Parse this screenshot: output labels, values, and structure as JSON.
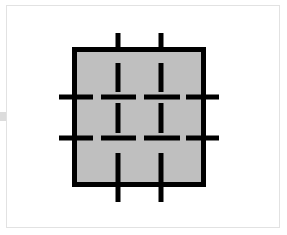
{
  "page": {
    "background_color": "#ffffff",
    "width": 287,
    "height": 235
  },
  "frame": {
    "name": "image-frame",
    "x": 6,
    "y": 5,
    "width": 274,
    "height": 223,
    "border_color": "#e2e2e2",
    "border_width": 1,
    "fill_color": "#ffffff"
  },
  "edge_tick": {
    "name": "left-edge-tick",
    "x": 0,
    "y": 112,
    "width": 6,
    "height": 9,
    "color": "#dcdcdc"
  },
  "chart_data": {
    "type": "diagram",
    "xlabel": "",
    "ylabel": "",
    "grid": true,
    "legend": null,
    "square": {
      "name": "filled-square",
      "x": 72,
      "y": 47,
      "width": 134,
      "height": 140,
      "fill_color": "#bfbfbf",
      "stroke_color": "#000000",
      "stroke_width": 5
    },
    "grid_lines": {
      "stroke_color": "#000000",
      "stroke_width": 5,
      "vertical": [
        {
          "name": "vertical-grid-line-1",
          "x": 118
        },
        {
          "name": "vertical-grid-line-2",
          "x": 161
        }
      ],
      "horizontal": [
        {
          "name": "horizontal-grid-line-1",
          "y": 97
        },
        {
          "name": "horizontal-grid-line-2",
          "y": 138
        }
      ],
      "extent": {
        "vertical_top": 33,
        "vertical_bottom": 202,
        "horizontal_left": 59,
        "horizontal_right": 219
      }
    },
    "vertical_segments": [
      {
        "name": "v1-stub-top",
        "x": 118,
        "y1": 33,
        "y2": 49
      },
      {
        "name": "v1-seg-upper",
        "x": 118,
        "y1": 63,
        "y2": 92
      },
      {
        "name": "v1-seg-middle",
        "x": 118,
        "y1": 103,
        "y2": 133
      },
      {
        "name": "v1-seg-lower",
        "x": 118,
        "y1": 153,
        "y2": 182
      },
      {
        "name": "v1-stub-bottom",
        "x": 118,
        "y1": 186,
        "y2": 202
      },
      {
        "name": "v2-stub-top",
        "x": 161,
        "y1": 33,
        "y2": 49
      },
      {
        "name": "v2-seg-upper",
        "x": 161,
        "y1": 63,
        "y2": 92
      },
      {
        "name": "v2-seg-middle",
        "x": 161,
        "y1": 103,
        "y2": 133
      },
      {
        "name": "v2-seg-lower",
        "x": 161,
        "y1": 153,
        "y2": 182
      },
      {
        "name": "v2-stub-bottom",
        "x": 161,
        "y1": 186,
        "y2": 202
      }
    ],
    "horizontal_segments": [
      {
        "name": "h1-stub-left",
        "y": 97,
        "x1": 59,
        "x2": 93
      },
      {
        "name": "h1-seg-center-a",
        "y": 97,
        "x1": 101,
        "x2": 136
      },
      {
        "name": "h1-seg-center-b",
        "y": 97,
        "x1": 144,
        "x2": 180
      },
      {
        "name": "h1-stub-right",
        "y": 97,
        "x1": 186,
        "x2": 219
      },
      {
        "name": "h2-stub-left",
        "y": 138,
        "x1": 59,
        "x2": 93
      },
      {
        "name": "h2-seg-center-a",
        "y": 138,
        "x1": 101,
        "x2": 136
      },
      {
        "name": "h2-seg-center-b",
        "y": 138,
        "x1": 144,
        "x2": 180
      },
      {
        "name": "h2-stub-right",
        "y": 138,
        "x1": 186,
        "x2": 219
      }
    ]
  }
}
